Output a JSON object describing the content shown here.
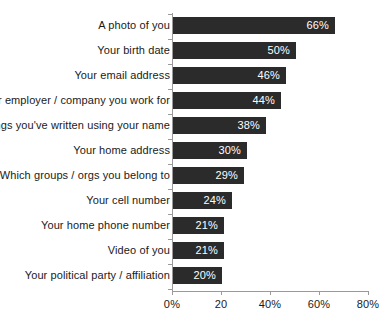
{
  "chart_data": {
    "type": "bar",
    "orientation": "horizontal",
    "title": "",
    "subtitle": "",
    "xlabel": "",
    "ylabel": "",
    "xlim": [
      0,
      80
    ],
    "grid": false,
    "legend": null,
    "bar_color": "#2b2b2b",
    "value_label_color": "#ffffff",
    "axis_color": "#9a9a9a",
    "text_color": "#1a1a1a",
    "categories": [
      "A photo of you",
      "Your birth date",
      "Your email address",
      "Your employer / company you work for",
      "Things you've written using your name",
      "Your home address",
      "Which groups / orgs you belong to",
      "Your cell number",
      "Your home phone number",
      "Video of you",
      "Your political party / affiliation"
    ],
    "values": [
      66,
      50,
      46,
      44,
      38,
      30,
      29,
      24,
      21,
      21,
      20
    ],
    "value_labels": [
      "66%",
      "50%",
      "46%",
      "44%",
      "38%",
      "30%",
      "29%",
      "24%",
      "21%",
      "21%",
      "20%"
    ],
    "xticks": [
      0,
      20,
      40,
      60,
      80
    ],
    "xtick_labels": [
      "0%",
      "20",
      "40%",
      "60%",
      "80%"
    ]
  }
}
